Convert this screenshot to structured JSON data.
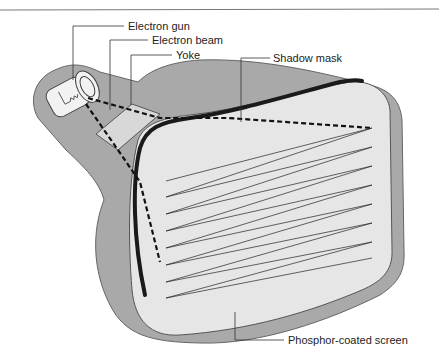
{
  "diagram": {
    "labels": {
      "electron_gun": "Electron gun",
      "electron_beam": "Electron beam",
      "yoke": "Yoke",
      "shadow_mask": "Shadow mask",
      "phosphor_screen": "Phosphor-coated screen"
    },
    "colors": {
      "tube_body": "#a9a9a9",
      "screen": "#e6e6e6",
      "outline": "#555555",
      "shadow_mask": "#1a1a1a",
      "beam": "#111111",
      "background": "#ffffff"
    }
  }
}
